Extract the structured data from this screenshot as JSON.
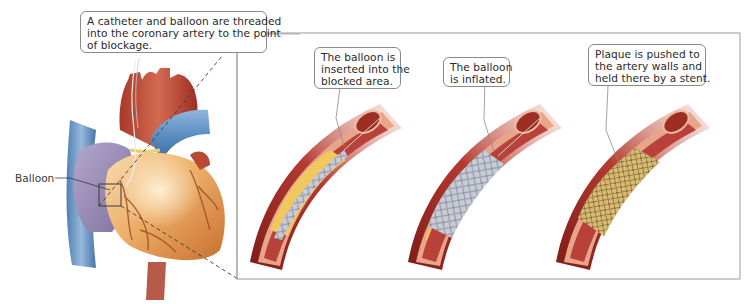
{
  "figure": {
    "type": "medical-illustration"
  },
  "callouts": {
    "main": {
      "lines": [
        "A catheter and balloon are threaded",
        "into the coronary artery to the point",
        "of blockage."
      ]
    },
    "step1": {
      "lines": [
        "The balloon is",
        "inserted into the",
        "blocked area."
      ]
    },
    "step2": {
      "lines": [
        "The balloon",
        "is inflated."
      ]
    },
    "step3": {
      "lines": [
        "Plaque is pushed to",
        "the artery walls and",
        "held there by a stent."
      ]
    }
  },
  "labels": {
    "balloon": "Balloon"
  },
  "colors": {
    "artery_outer": "#a8302a",
    "artery_wall": "#e9a58a",
    "artery_lumen": "#b8423a",
    "plaque": "#efc860",
    "balloon": "#c9ccd6",
    "stent": "#d2b060",
    "heart_ventricle": "#e8a860",
    "heart_atrium": "#9c8fb8",
    "vein_blue": "#5f8fc0",
    "aorta": "#c2523a",
    "frame": "#9a9a9a",
    "callout_border": "#8a8a8a",
    "text": "#2a2a2a"
  }
}
